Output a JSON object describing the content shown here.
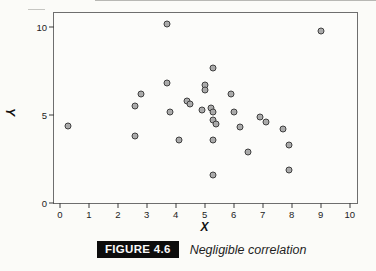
{
  "figure": {
    "caption_label": "FIGURE 4.6",
    "caption_text": "Negligible correlation"
  },
  "chart_data": {
    "type": "scatter",
    "title": "",
    "xlabel": "X",
    "ylabel": "Y",
    "xlim": [
      -0.2,
      10.25
    ],
    "ylim": [
      0,
      10.8
    ],
    "x_ticks": [
      0,
      1,
      2,
      3,
      4,
      5,
      6,
      7,
      8,
      9,
      10
    ],
    "y_ticks": [
      0,
      5,
      10
    ],
    "grid": false,
    "legend": "none",
    "marker": {
      "shape": "circle",
      "fill": "#a9a9a9",
      "stroke": "#3e3e3e",
      "diameter_px": 7
    },
    "points": [
      [
        0.3,
        4.4
      ],
      [
        2.6,
        5.5
      ],
      [
        2.6,
        3.8
      ],
      [
        2.8,
        6.2
      ],
      [
        3.7,
        10.2
      ],
      [
        3.7,
        6.8
      ],
      [
        3.8,
        5.2
      ],
      [
        4.1,
        3.6
      ],
      [
        4.4,
        5.8
      ],
      [
        4.5,
        5.6
      ],
      [
        4.9,
        5.3
      ],
      [
        5.0,
        6.7
      ],
      [
        5.0,
        6.4
      ],
      [
        5.2,
        5.4
      ],
      [
        5.3,
        5.2
      ],
      [
        5.3,
        7.7
      ],
      [
        5.3,
        4.7
      ],
      [
        5.4,
        4.5
      ],
      [
        5.3,
        3.6
      ],
      [
        5.3,
        1.6
      ],
      [
        5.9,
        6.2
      ],
      [
        6.0,
        5.2
      ],
      [
        6.2,
        4.3
      ],
      [
        6.5,
        2.9
      ],
      [
        6.9,
        4.9
      ],
      [
        7.1,
        4.6
      ],
      [
        7.7,
        4.2
      ],
      [
        7.9,
        3.3
      ],
      [
        7.9,
        1.9
      ],
      [
        9.0,
        9.8
      ]
    ]
  },
  "colors": {
    "page_bg": "#fbfbf8",
    "frame_border": "#6e6e6e",
    "marker_fill": "#a9a9a9",
    "marker_stroke": "#3e3e3e",
    "caption_box_bg": "#0c0c0c",
    "caption_box_text": "#fafafa"
  }
}
